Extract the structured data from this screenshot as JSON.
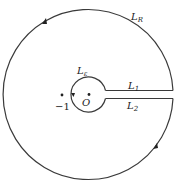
{
  "diagram": {
    "type": "keyhole-contour",
    "labels": {
      "outer_arc": {
        "main": "L",
        "sub": "R"
      },
      "inner_arc": {
        "main": "L",
        "sub": "ε"
      },
      "upper_segment": {
        "main": "L",
        "sub": "1"
      },
      "lower_segment": {
        "main": "L",
        "sub": "2"
      },
      "origin": "O",
      "minus_one": "−1"
    },
    "points": [
      {
        "name": "origin",
        "label": "O"
      },
      {
        "name": "minus-one",
        "label": "−1"
      }
    ],
    "colors": {
      "stroke": "#3a3a3a",
      "text": "#222222"
    }
  }
}
